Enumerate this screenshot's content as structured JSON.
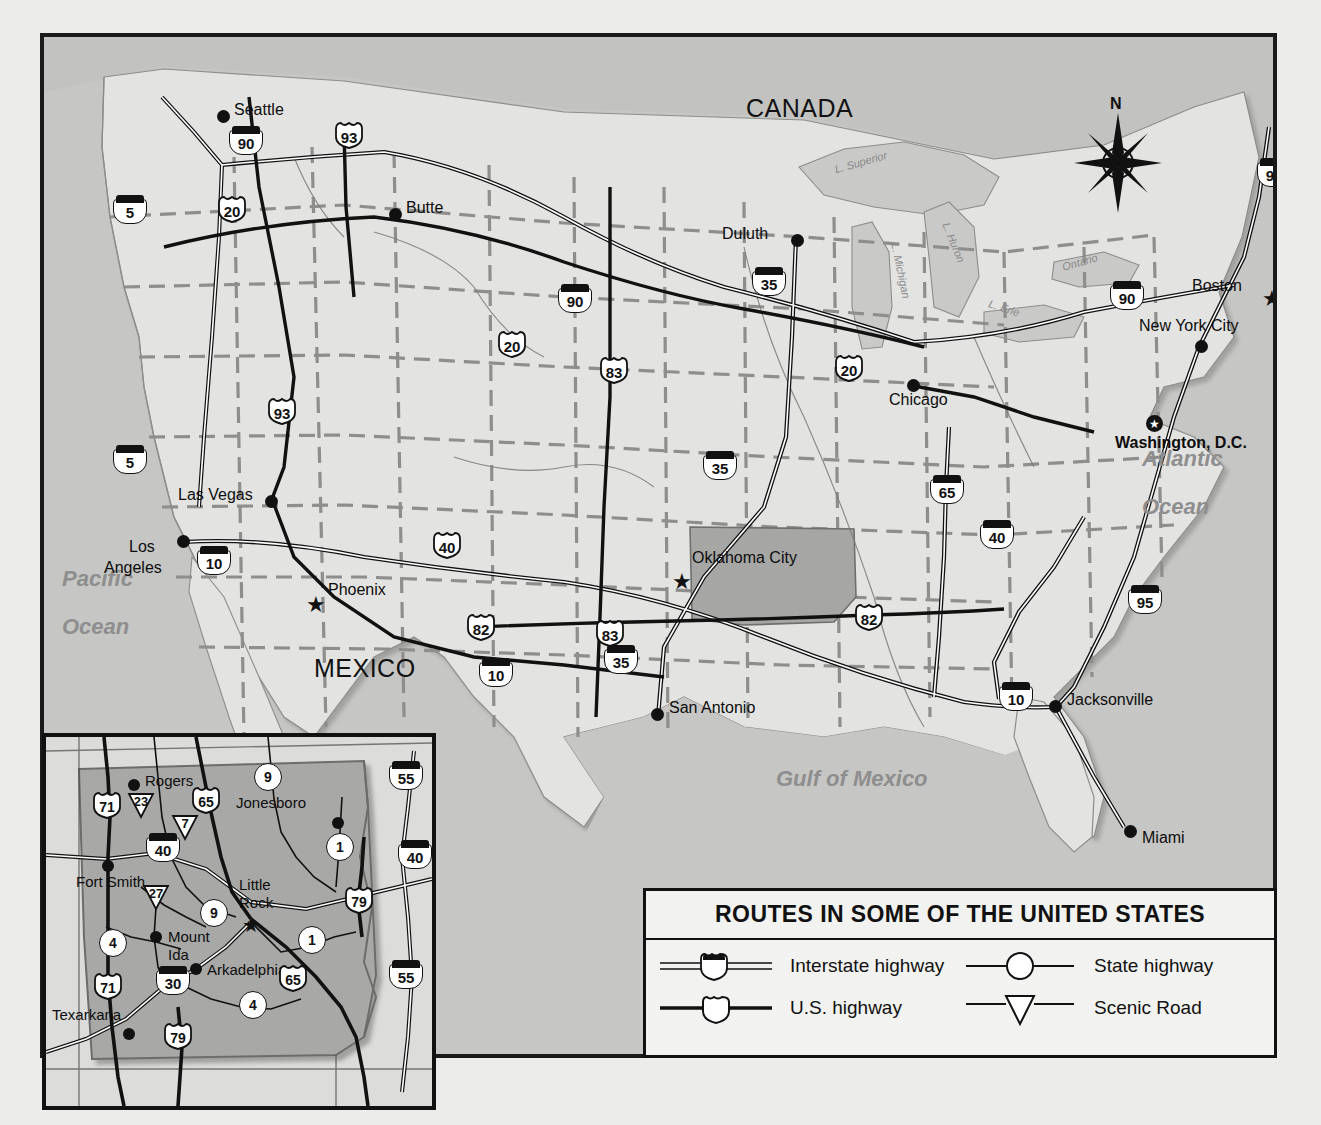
{
  "map": {
    "title": "ROUTES IN SOME OF THE UNITED STATES",
    "countries": [
      {
        "name": "CANADA",
        "x": 742,
        "y": 70
      },
      {
        "name": "MEXICO",
        "x": 310,
        "y": 650
      }
    ],
    "water_bodies": [
      {
        "name": "Pacific",
        "x": 58,
        "y": 560
      },
      {
        "name": "Ocean",
        "x": 58,
        "y": 605
      },
      {
        "name": "Atlantic",
        "x": 1138,
        "y": 440
      },
      {
        "name": "Ocean",
        "x": 1138,
        "y": 485
      },
      {
        "name": "Gulf of Mexico",
        "x": 772,
        "y": 755
      }
    ],
    "lakes": [
      {
        "name": "L. Superior",
        "x": 824,
        "y": 140,
        "rot": -16
      },
      {
        "name": "L. Michigan",
        "x": 861,
        "y": 250,
        "rot": 78
      },
      {
        "name": "L. Huron",
        "x": 919,
        "y": 222,
        "rot": 68
      },
      {
        "name": "L. Erie",
        "x": 977,
        "y": 281,
        "rot": 18
      },
      {
        "name": "Ontario",
        "x": 1053,
        "y": 236,
        "rot": -16
      }
    ],
    "cities": [
      {
        "name": "Seattle",
        "x": 180,
        "y": 80,
        "marker": "dot",
        "label_dx": 14,
        "label_dy": -9
      },
      {
        "name": "Butte",
        "x": 352,
        "y": 178,
        "marker": "dot",
        "label_dx": 14,
        "label_dy": -9
      },
      {
        "name": "Duluth",
        "x": 754,
        "y": 204,
        "marker": "dot",
        "label_dx": -70,
        "label_dy": -9
      },
      {
        "name": "Boston",
        "x": 1227,
        "y": 255,
        "marker": "star",
        "label_dx": -72,
        "label_dy": -11
      },
      {
        "name": "New York City",
        "x": 1158,
        "y": 310,
        "marker": "dot",
        "label_dx": -22,
        "label_dy": -26
      },
      {
        "name": "Chicago",
        "x": 870,
        "y": 349,
        "marker": "dot",
        "label_dx": 14,
        "label_dy": 4
      },
      {
        "name": "Washington, D.C.",
        "x": 1110,
        "y": 386,
        "marker": "capital",
        "label_dx": 2,
        "label_dy": 16,
        "bold": true
      },
      {
        "name": "Las Vegas",
        "x": 228,
        "y": 465,
        "marker": "dot",
        "label_dx": -90,
        "label_dy": -9
      },
      {
        "name": "Los Angeles",
        "x": 140,
        "y": 505,
        "marker": "dot",
        "label_dx": -58,
        "label_dy": 2,
        "two_line": true
      },
      {
        "name": "Phoenix",
        "x": 270,
        "y": 560,
        "marker": "star",
        "label_dx": 14,
        "label_dy": -9
      },
      {
        "name": "Oklahoma City",
        "x": 637,
        "y": 537,
        "marker": "star",
        "label_dx": 14,
        "label_dy": -18
      },
      {
        "name": "San Antonio",
        "x": 614,
        "y": 678,
        "marker": "dot",
        "label_dx": 14,
        "label_dy": -9
      },
      {
        "name": "Jacksonville",
        "x": 1012,
        "y": 670,
        "marker": "dot",
        "label_dx": 14,
        "label_dy": -9
      },
      {
        "name": "Miami",
        "x": 1087,
        "y": 795,
        "marker": "dot",
        "label_dx": 14,
        "label_dy": 5
      }
    ],
    "shields": [
      {
        "type": "interstate",
        "num": "90",
        "x": 202,
        "y": 103
      },
      {
        "type": "us",
        "num": "93",
        "x": 305,
        "y": 98
      },
      {
        "type": "interstate",
        "num": "5",
        "x": 86,
        "y": 172
      },
      {
        "type": "us",
        "num": "20",
        "x": 188,
        "y": 172
      },
      {
        "type": "interstate",
        "num": "90",
        "x": 531,
        "y": 261
      },
      {
        "type": "us",
        "num": "20",
        "x": 468,
        "y": 307
      },
      {
        "type": "us",
        "num": "83",
        "x": 570,
        "y": 333
      },
      {
        "type": "interstate",
        "num": "35",
        "x": 725,
        "y": 244
      },
      {
        "type": "us",
        "num": "20",
        "x": 805,
        "y": 331
      },
      {
        "type": "interstate",
        "num": "90",
        "x": 1083,
        "y": 258
      },
      {
        "type": "interstate",
        "num": "95",
        "x": 1230,
        "y": 135
      },
      {
        "type": "us",
        "num": "93",
        "x": 238,
        "y": 374
      },
      {
        "type": "interstate",
        "num": "5",
        "x": 86,
        "y": 422
      },
      {
        "type": "interstate",
        "num": "35",
        "x": 676,
        "y": 428
      },
      {
        "type": "interstate",
        "num": "65",
        "x": 903,
        "y": 452
      },
      {
        "type": "interstate",
        "num": "40",
        "x": 953,
        "y": 497
      },
      {
        "type": "us",
        "num": "40",
        "x": 403,
        "y": 508
      },
      {
        "type": "interstate",
        "num": "10",
        "x": 170,
        "y": 523
      },
      {
        "type": "us",
        "num": "82",
        "x": 437,
        "y": 590
      },
      {
        "type": "us",
        "num": "83",
        "x": 566,
        "y": 596
      },
      {
        "type": "us",
        "num": "82",
        "x": 825,
        "y": 580
      },
      {
        "type": "interstate",
        "num": "95",
        "x": 1101,
        "y": 562
      },
      {
        "type": "interstate",
        "num": "35",
        "x": 577,
        "y": 622
      },
      {
        "type": "interstate",
        "num": "10",
        "x": 452,
        "y": 635
      },
      {
        "type": "interstate",
        "num": "10",
        "x": 972,
        "y": 659
      }
    ],
    "compass": {
      "north_label": "N"
    }
  },
  "inset": {
    "state": "Arkansas",
    "cities": [
      {
        "name": "Rogers",
        "x": 88,
        "y": 48,
        "marker": "dot",
        "label_dx": 14,
        "label_dy": -9
      },
      {
        "name": "Jonesboro",
        "x": 292,
        "y": 86,
        "marker": "dot",
        "label_dx": -100,
        "label_dy": -24
      },
      {
        "name": "Fort Smith",
        "x": 62,
        "y": 129,
        "marker": "dot",
        "label_dx": -2,
        "label_dy": 10
      },
      {
        "name": "Little Rock",
        "x": 203,
        "y": 182,
        "marker": "star",
        "label_dx": -10,
        "label_dy": -42,
        "two_line": true
      },
      {
        "name": "Mount Ida",
        "x": 110,
        "y": 200,
        "marker": "dot",
        "label_dx": 14,
        "label_dy": -7,
        "two_line": true
      },
      {
        "name": "Arkadelphia",
        "x": 150,
        "y": 232,
        "marker": "dot",
        "label_dx": 14,
        "label_dy": -7
      },
      {
        "name": "Texarkana",
        "x": 83,
        "y": 297,
        "marker": "dot",
        "label_dx": -82,
        "label_dy": -22
      }
    ],
    "shields": [
      {
        "type": "us",
        "num": "71",
        "x": 61,
        "y": 68
      },
      {
        "type": "scenic",
        "num": "23",
        "x": 95,
        "y": 68
      },
      {
        "type": "us",
        "num": "65",
        "x": 160,
        "y": 63
      },
      {
        "type": "state",
        "num": "9",
        "x": 222,
        "y": 40
      },
      {
        "type": "interstate",
        "num": "55",
        "x": 360,
        "y": 38
      },
      {
        "type": "scenic",
        "num": "7",
        "x": 139,
        "y": 90
      },
      {
        "type": "interstate",
        "num": "40",
        "x": 117,
        "y": 110
      },
      {
        "type": "state",
        "num": "1",
        "x": 294,
        "y": 110
      },
      {
        "type": "interstate",
        "num": "40",
        "x": 369,
        "y": 117
      },
      {
        "type": "scenic",
        "num": "27",
        "x": 110,
        "y": 160
      },
      {
        "type": "state",
        "num": "9",
        "x": 168,
        "y": 176
      },
      {
        "type": "us",
        "num": "79",
        "x": 313,
        "y": 163
      },
      {
        "type": "state",
        "num": "4",
        "x": 67,
        "y": 206
      },
      {
        "type": "state",
        "num": "1",
        "x": 266,
        "y": 203
      },
      {
        "type": "us",
        "num": "71",
        "x": 62,
        "y": 249
      },
      {
        "type": "interstate",
        "num": "30",
        "x": 127,
        "y": 243
      },
      {
        "type": "us",
        "num": "65",
        "x": 247,
        "y": 241
      },
      {
        "type": "interstate",
        "num": "55",
        "x": 360,
        "y": 237
      },
      {
        "type": "state",
        "num": "4",
        "x": 207,
        "y": 268
      },
      {
        "type": "us",
        "num": "79",
        "x": 132,
        "y": 299
      }
    ]
  },
  "legend": {
    "title": "ROUTES IN SOME OF THE UNITED STATES",
    "items": [
      {
        "label": "Interstate highway",
        "symbol": "interstate-shield"
      },
      {
        "label": "State highway",
        "symbol": "state-circle"
      },
      {
        "label": "U.S. highway",
        "symbol": "us-shield"
      },
      {
        "label": "Scenic Road",
        "symbol": "scenic-triangle"
      }
    ]
  }
}
